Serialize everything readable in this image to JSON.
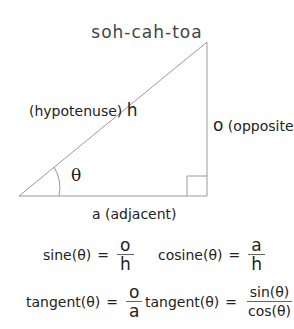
{
  "title": "soh-cah-toa",
  "triangle": {
    "hypotenuse_label": "(hypotenuse)",
    "hypotenuse_symbol": "h",
    "opposite_symbol": "o",
    "opposite_label": "(opposite)",
    "adjacent_label": "a (adjacent)",
    "angle_symbol": "θ",
    "line_color": "#999999"
  },
  "formulas": [
    {
      "lhs": "sine(θ)",
      "eq": "=",
      "num": "o",
      "den": "h"
    },
    {
      "lhs": "cosine(θ)",
      "eq": "=",
      "num": "a",
      "den": "h"
    },
    {
      "lhs": "tangent(θ)",
      "eq": "=",
      "num": "o",
      "den": "a"
    },
    {
      "lhs": "tangent(θ)",
      "eq": "=",
      "num": "sin(θ)",
      "den": "cos(θ)"
    }
  ]
}
